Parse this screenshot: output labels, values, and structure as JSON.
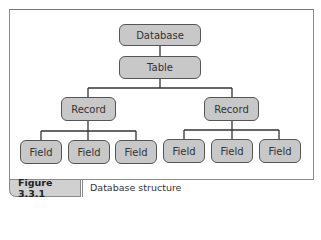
{
  "diagram": {
    "type": "hierarchy",
    "root": {
      "label": "Database"
    },
    "table": {
      "label": "Table"
    },
    "records": [
      {
        "label": "Record",
        "fields": [
          {
            "label": "Field"
          },
          {
            "label": "Field"
          },
          {
            "label": "Field"
          }
        ]
      },
      {
        "label": "Record",
        "fields": [
          {
            "label": "Field"
          },
          {
            "label": "Field"
          },
          {
            "label": "Field"
          }
        ]
      }
    ],
    "colors": {
      "node_fill": "#c8c8c8",
      "node_border": "#555555",
      "line": "#333333"
    }
  },
  "caption": {
    "number": "Figure 3.3.1",
    "text": "Database structure"
  }
}
